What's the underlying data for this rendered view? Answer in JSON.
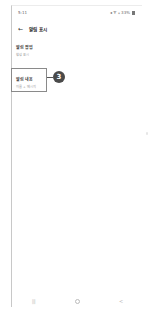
{
  "status_bar": {
    "time": "5:11",
    "icons": [
      "mute-icon",
      "signal-icon",
      "wifi-icon"
    ],
    "battery_percent": "33%"
  },
  "app_bar": {
    "back_icon": "←",
    "title": "알림 표시"
  },
  "sections": [
    {
      "title": "알림 팝업",
      "subtitle": "항상 표시"
    },
    {
      "title": "알림 내용",
      "subtitle": "이름 + 메시지"
    }
  ],
  "callout": {
    "number": "3",
    "color": "#4a4a4a"
  },
  "nav_bar": {
    "recents": "|||",
    "home": "",
    "back": "<"
  }
}
